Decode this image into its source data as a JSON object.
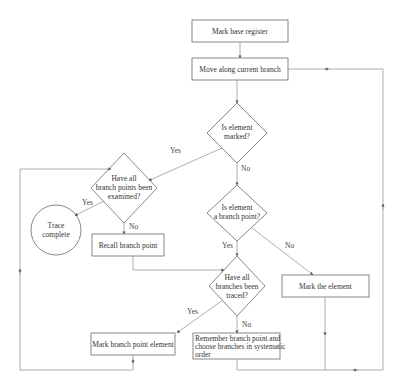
{
  "diagram": {
    "type": "flowchart",
    "nodes": {
      "mark_base": {
        "shape": "process",
        "label": "Mark base register"
      },
      "move_along": {
        "shape": "process",
        "label": "Move along current branch"
      },
      "is_marked": {
        "shape": "decision",
        "line1": "Is element",
        "line2": "marked?"
      },
      "all_points": {
        "shape": "decision",
        "line1": "Have all",
        "line2": "branch points been",
        "line3": "examined?"
      },
      "trace_complete": {
        "shape": "terminal",
        "line1": "Trace",
        "line2": "complete"
      },
      "recall_point": {
        "shape": "process",
        "label": "Recall branch point"
      },
      "is_branch_point": {
        "shape": "decision",
        "line1": "Is element",
        "line2": "a branch point?"
      },
      "all_branches": {
        "shape": "decision",
        "line1": "Have all",
        "line2": "branches been",
        "line3": "traced?"
      },
      "mark_element": {
        "shape": "process",
        "label": "Mark the element"
      },
      "mark_bp_element": {
        "shape": "process",
        "label": "Mark branch point element"
      },
      "remember_bp": {
        "shape": "process",
        "line1": "Remember branch point and",
        "line2": "choose branches in systematic",
        "line3": "order"
      }
    },
    "edge_labels": {
      "marked_yes": "Yes",
      "marked_no": "No",
      "points_yes": "Yes",
      "points_no": "No",
      "bp_yes": "Yes",
      "bp_no": "No",
      "branches_yes": "Yes",
      "branches_no": "No"
    },
    "colors": {
      "line": "#9a9a9a",
      "box": "#7a7a7a",
      "text": "#333333"
    }
  }
}
